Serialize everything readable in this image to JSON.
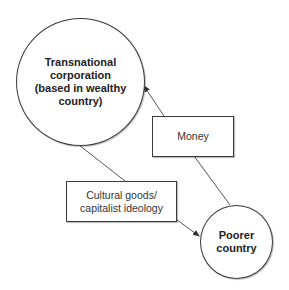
{
  "diagram": {
    "type": "flow",
    "nodes": [
      {
        "id": "tnc",
        "shape": "circle",
        "label": "Transnational\ncorporation\n(based in wealthy\ncountry)"
      },
      {
        "id": "money",
        "shape": "rectangle",
        "label": "Money"
      },
      {
        "id": "cultural",
        "shape": "rectangle",
        "label": "Cultural goods/\ncapitalist ideology"
      },
      {
        "id": "poorer",
        "shape": "circle",
        "label": "Poorer\ncountry"
      }
    ],
    "edges": [
      {
        "from": "poorer",
        "to": "tnc",
        "via": "money",
        "label": "Money",
        "arrow": "to"
      },
      {
        "from": "tnc",
        "to": "poorer",
        "via": "cultural",
        "label": "Cultural goods/capitalist ideology",
        "arrow": "to"
      }
    ],
    "colors": {
      "stroke": "#3a3a3a",
      "fill": "#ffffff",
      "text": "#222222"
    }
  }
}
